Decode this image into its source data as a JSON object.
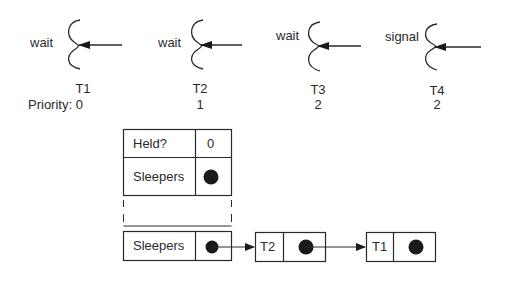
{
  "threads": [
    {
      "id": "T1",
      "operation": "wait",
      "priority": "0",
      "x": 83
    },
    {
      "id": "T2",
      "operation": "wait",
      "priority": "1",
      "x": 200
    },
    {
      "id": "T3",
      "operation": "wait",
      "priority": "2",
      "x": 318
    },
    {
      "id": "T4",
      "operation": "signal",
      "priority": "2",
      "x": 437
    }
  ],
  "priority_label": "Priority: 0",
  "lock": {
    "held_label": "Held?",
    "held_value": "0",
    "sleepers_label": "Sleepers"
  },
  "sleeper_queue": {
    "head_label": "Sleepers",
    "nodes": [
      {
        "label": "T2"
      },
      {
        "label": "T1"
      }
    ]
  },
  "colors": {
    "stroke": "#2a2a2a",
    "fill_dot": "#1a1a1a",
    "background": "#ffffff"
  }
}
